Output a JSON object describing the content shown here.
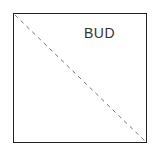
{
  "diagram": {
    "label": "BUD",
    "frame": {
      "shape": "square",
      "stroke": "#222222"
    },
    "diagonal": {
      "style": "dashed",
      "from": "top-left",
      "to": "bottom-right",
      "color": "#777777"
    }
  }
}
